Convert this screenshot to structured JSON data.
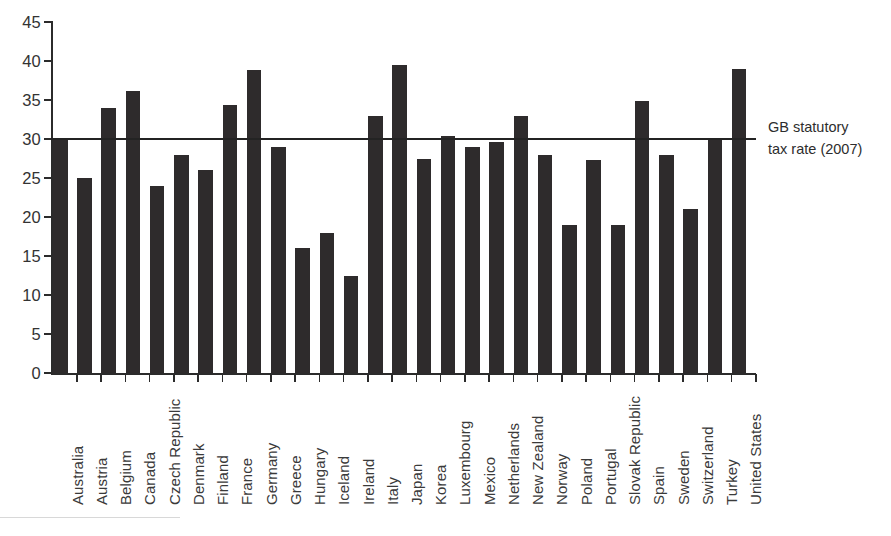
{
  "chart_data": {
    "type": "bar",
    "title": "",
    "xlabel": "",
    "ylabel": "",
    "ylim": [
      0,
      45
    ],
    "ytick_step": 5,
    "yticks": [
      0,
      5,
      10,
      15,
      20,
      25,
      30,
      35,
      40,
      45
    ],
    "grid": false,
    "legend": "none",
    "bar_color": "#2e2b2c",
    "categories": [
      "Australia",
      "Austria",
      "Belgium",
      "Canada",
      "Czech Republic",
      "Denmark",
      "Finland",
      "France",
      "Germany",
      "Greece",
      "Hungary",
      "Iceland",
      "Ireland",
      "Italy",
      "Japan",
      "Korea",
      "Luxembourg",
      "Mexico",
      "Netherlands",
      "New Zealand",
      "Norway",
      "Poland",
      "Portugal",
      "Slovak Republic",
      "Spain",
      "Sweden",
      "Switzerland",
      "Turkey",
      "United States"
    ],
    "values": [
      30.0,
      25.0,
      34.0,
      36.1,
      24.0,
      28.0,
      26.0,
      34.4,
      38.9,
      29.0,
      16.0,
      18.0,
      12.5,
      33.0,
      39.5,
      27.5,
      30.4,
      29.0,
      29.6,
      33.0,
      28.0,
      19.0,
      27.3,
      19.0,
      34.9,
      28.0,
      21.0,
      30.0,
      39.0
    ],
    "annotations": [
      {
        "type": "hline",
        "value": 30,
        "label_line1": "GB statutory",
        "label_line2": "tax rate (2007)",
        "color": "#232323"
      }
    ]
  }
}
